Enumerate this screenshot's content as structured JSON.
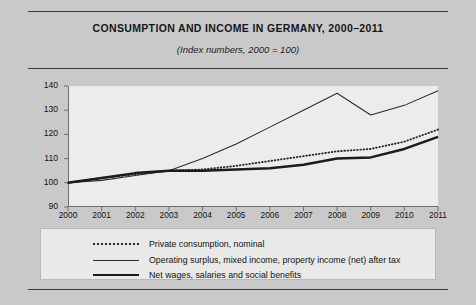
{
  "header": {
    "title": "CONSUMPTION AND INCOME IN GERMANY, 2000–2011",
    "subtitle": "(Index numbers, 2000 = 100)"
  },
  "chart_data": {
    "type": "line",
    "title": "CONSUMPTION AND INCOME IN GERMANY, 2000–2011",
    "subtitle": "(Index numbers, 2000 = 100)",
    "xlabel": "",
    "ylabel": "",
    "x": [
      2000,
      2001,
      2002,
      2003,
      2004,
      2005,
      2006,
      2007,
      2008,
      2009,
      2010,
      2011
    ],
    "xticklabels": [
      "2000",
      "2001",
      "2002",
      "2003",
      "2004",
      "2005",
      "2006",
      "2007",
      "2008",
      "2009",
      "2010",
      "2011"
    ],
    "ylim": [
      90,
      140
    ],
    "yticks": [
      90,
      100,
      110,
      120,
      130,
      140
    ],
    "yticklabels": [
      "90",
      "100",
      "110",
      "120",
      "130",
      "140"
    ],
    "grid": false,
    "legend_position": "bottom",
    "series": [
      {
        "name": "Private consumption, nominal",
        "style": "dotted",
        "color": "#2b2b2b",
        "values": [
          100,
          102,
          103.5,
          105,
          105.5,
          107,
          109,
          111,
          113,
          114,
          117,
          122
        ]
      },
      {
        "name": "Operating surplus, mixed income, property income (net) after tax",
        "style": "thin-solid",
        "color": "#2b2b2b",
        "values": [
          100,
          101,
          103,
          105,
          110,
          116,
          123,
          130,
          137,
          128,
          132,
          138
        ]
      },
      {
        "name": "Net wages, salaries and social benefits",
        "style": "thick-solid",
        "color": "#1b1b1b",
        "values": [
          100,
          102,
          104,
          105,
          105,
          105.5,
          106,
          107.5,
          110,
          110.5,
          114,
          119
        ]
      }
    ]
  },
  "legend": {
    "items": [
      "Private consumption, nominal",
      "Operating surplus, mixed income, property income (net) after tax",
      "Net wages, salaries and social benefits"
    ]
  }
}
